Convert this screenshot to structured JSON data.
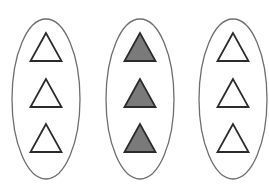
{
  "diagram": {
    "background": "#ffffff",
    "stroke_color": "#2b2b2b",
    "ellipse_stroke_color": "#6e6e6e",
    "groups": [
      {
        "id": "group-1",
        "center_x": 46,
        "center_y": 99,
        "rx": 34,
        "ry": 80,
        "triangles": [
          {
            "fill": "#ffffff",
            "shaded": false
          },
          {
            "fill": "#ffffff",
            "shaded": false
          },
          {
            "fill": "#ffffff",
            "shaded": false
          }
        ]
      },
      {
        "id": "group-2",
        "center_x": 140,
        "center_y": 99,
        "rx": 34,
        "ry": 80,
        "triangles": [
          {
            "fill": "#7a7a7a",
            "shaded": true
          },
          {
            "fill": "#7a7a7a",
            "shaded": true
          },
          {
            "fill": "#7a7a7a",
            "shaded": true
          }
        ]
      },
      {
        "id": "group-3",
        "center_x": 233,
        "center_y": 99,
        "rx": 34,
        "ry": 80,
        "triangles": [
          {
            "fill": "#ffffff",
            "shaded": false
          },
          {
            "fill": "#ffffff",
            "shaded": false
          },
          {
            "fill": "#ffffff",
            "shaded": false
          }
        ]
      }
    ],
    "triangle_rows": [
      {
        "apex_y": 33,
        "base_y": 61
      },
      {
        "apex_y": 79,
        "base_y": 107
      },
      {
        "apex_y": 124,
        "base_y": 152
      }
    ],
    "triangle_half_width": 15.5
  }
}
